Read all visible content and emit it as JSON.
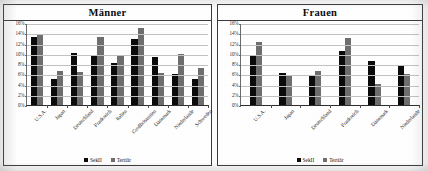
{
  "figure": {
    "background_color": "#ffffff",
    "border_color": "#3a3a3a"
  },
  "legend": {
    "series1_label": "SekII",
    "series2_label": "Tertiär",
    "series1_color": "#0b0b0b",
    "series2_color": "#6e6e6e",
    "position": "bottom-center"
  },
  "axis": {
    "ticks": [
      "16%",
      "14%",
      "12%",
      "10%",
      "8%",
      "6%",
      "4%",
      "2%",
      "0%"
    ]
  },
  "chart_data": [
    {
      "type": "bar",
      "title": "Männer",
      "xlabel": "",
      "ylabel": "",
      "ylim": [
        0,
        16
      ],
      "yticks": [
        0,
        2,
        4,
        6,
        8,
        10,
        12,
        14,
        16
      ],
      "ytick_labels": [
        "0%",
        "2%",
        "4%",
        "6%",
        "8%",
        "10%",
        "12%",
        "14%",
        "16%"
      ],
      "grid": true,
      "legend_position": "bottom-center",
      "categories": [
        "U.S.A.",
        "Japan",
        "Deutschland",
        "Frankreich",
        "Italien",
        "Großbritannien",
        "Dänemark",
        "Niederlande",
        "Schweden"
      ],
      "series": [
        {
          "name": "SekII",
          "color": "#0b0b0b",
          "values": [
            13.2,
            5.0,
            10.2,
            9.6,
            8.2,
            12.9,
            9.3,
            6.1,
            5.1
          ]
        },
        {
          "name": "Tertiär",
          "color": "#6e6e6e",
          "values": [
            13.7,
            6.7,
            6.4,
            13.3,
            9.7,
            15.1,
            6.2,
            10.0,
            7.3
          ]
        }
      ]
    },
    {
      "type": "bar",
      "title": "Frauen",
      "xlabel": "",
      "ylabel": "",
      "ylim": [
        0,
        16
      ],
      "yticks": [
        0,
        2,
        4,
        6,
        8,
        10,
        12,
        14,
        16
      ],
      "ytick_labels": [
        "0%",
        "2%",
        "4%",
        "6%",
        "8%",
        "10%",
        "12%",
        "14%",
        "16%"
      ],
      "grid": true,
      "legend_position": "bottom-center",
      "categories": [
        "U.S.A.",
        "Japan",
        "Deutschland",
        "Frankreich",
        "Dänemark",
        "Niederlande"
      ],
      "series": [
        {
          "name": "SekII",
          "color": "#0b0b0b",
          "values": [
            9.6,
            6.3,
            5.9,
            10.5,
            8.5,
            7.7
          ]
        },
        {
          "name": "Tertiär",
          "color": "#6e6e6e",
          "values": [
            12.2,
            5.6,
            6.7,
            13.0,
            4.1,
            6.1
          ]
        }
      ]
    }
  ]
}
